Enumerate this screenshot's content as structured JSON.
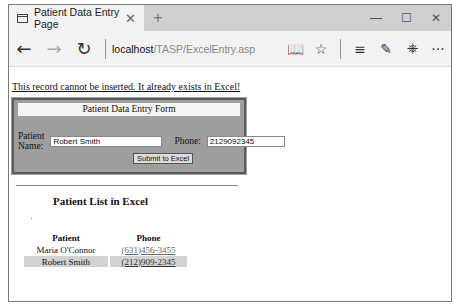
{
  "browser": {
    "tab_title": "Patient Data Entry Page",
    "tab_close": "✕",
    "new_tab": "+",
    "window_controls": {
      "minimize": "—",
      "maximize": "☐",
      "close": "✕"
    },
    "nav": {
      "back": "←",
      "forward": "→",
      "refresh": "↻"
    },
    "url_host": "localhost",
    "url_path": "/TASP/ExcelEntry.asp",
    "toolbar": {
      "reading_view": "📖",
      "favorites": "☆",
      "hub": "≡",
      "notes": "✎",
      "share": "⎈",
      "more": "···"
    }
  },
  "page": {
    "error_message": "This record cannot be inserted. It already exists in Excel!",
    "form": {
      "title": "Patient Data Entry Form",
      "name_label": "Patient Name:",
      "name_value": "Robert Smith",
      "phone_label": "Phone:",
      "phone_value": "2129092345",
      "submit_label": "Submit to Excel"
    },
    "list": {
      "title": "Patient List in Excel",
      "columns": [
        "Patient",
        "Phone"
      ],
      "rows": [
        {
          "patient": "Maria O'Connor",
          "phone": "(631)456-3455"
        },
        {
          "patient": "Robert Smith",
          "phone": "(212)909-2345"
        }
      ]
    }
  }
}
